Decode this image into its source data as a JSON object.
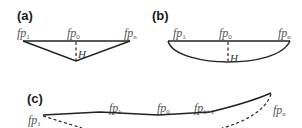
{
  "panels": {
    "a": {
      "label": "(a)",
      "points": [
        {
          "name": "fp",
          "sub": "1"
        },
        {
          "name": "fp",
          "sub": "0"
        },
        {
          "name": "fp",
          "sub": "n"
        }
      ],
      "height_label": "H",
      "shape": "triangle"
    },
    "b": {
      "label": "(b)",
      "points": [
        {
          "name": "fp",
          "sub": "1"
        },
        {
          "name": "fp",
          "sub": "0"
        },
        {
          "name": "fp",
          "sub": "n"
        }
      ],
      "height_label": "H",
      "shape": "arc"
    },
    "c": {
      "label": "(c)",
      "points": [
        {
          "name": "fp",
          "sub": "1"
        },
        {
          "name": "fp",
          "sub": "k"
        },
        {
          "name": "fp",
          "sub": "0"
        },
        {
          "name": "fp",
          "sub": "k+1"
        },
        {
          "name": "fp",
          "sub": "n"
        }
      ],
      "shape": "curve-with-dashed-chord"
    }
  },
  "colors": {
    "line": "#222222",
    "label": "#555555"
  }
}
